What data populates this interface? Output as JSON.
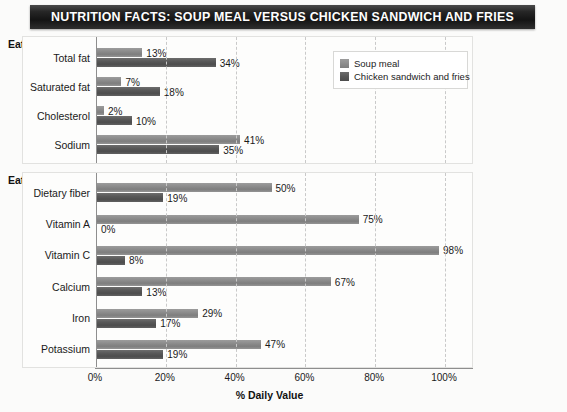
{
  "title": "NUTRITION FACTS:  SOUP MEAL VERSUS CHICKEN SANDWICH AND FRIES",
  "sections": {
    "eat_less_heading": "Eat less of these:",
    "eat_more_heading": "Eat more of these:"
  },
  "legend": {
    "items": [
      {
        "label": "Soup meal",
        "color": "#8d8d8d"
      },
      {
        "label": "Chicken sandwich and fries",
        "color": "#595959"
      }
    ]
  },
  "axis": {
    "title": "% Daily Value",
    "ticks": [
      "0%",
      "20%",
      "40%",
      "60%",
      "80%",
      "100%"
    ],
    "tick_values": [
      0,
      20,
      40,
      60,
      80,
      100
    ]
  },
  "chart_data": [
    {
      "type": "bar",
      "title": "Eat less of these:",
      "orientation": "horizontal",
      "categories": [
        "Total fat",
        "Saturated fat",
        "Cholesterol",
        "Sodium"
      ],
      "series": [
        {
          "name": "Soup meal",
          "values": [
            13,
            7,
            2,
            41
          ],
          "labels": [
            "13%",
            "7%",
            "2%",
            "41%"
          ],
          "color": "#8d8d8d"
        },
        {
          "name": "Chicken sandwich and fries",
          "values": [
            34,
            18,
            10,
            35
          ],
          "labels": [
            "34%",
            "18%",
            "10%",
            "35%"
          ],
          "color": "#595959"
        }
      ],
      "xlabel": "% Daily Value",
      "ylabel": "",
      "xlim": [
        0,
        100
      ],
      "grid": true,
      "legend_position": "inside-right"
    },
    {
      "type": "bar",
      "title": "Eat more of these:",
      "orientation": "horizontal",
      "categories": [
        "Dietary fiber",
        "Vitamin A",
        "Vitamin C",
        "Calcium",
        "Iron",
        "Potassium"
      ],
      "series": [
        {
          "name": "Soup meal",
          "values": [
            50,
            75,
            98,
            67,
            29,
            47
          ],
          "labels": [
            "50%",
            "75%",
            "98%",
            "67%",
            "29%",
            "47%"
          ],
          "color": "#8d8d8d"
        },
        {
          "name": "Chicken sandwich and fries",
          "values": [
            19,
            0,
            8,
            13,
            17,
            19
          ],
          "labels": [
            "19%",
            "0%",
            "8%",
            "13%",
            "17%",
            "19%"
          ],
          "color": "#595959"
        }
      ],
      "xlabel": "% Daily Value",
      "ylabel": "",
      "xlim": [
        0,
        100
      ],
      "grid": true,
      "legend_position": "none"
    }
  ]
}
